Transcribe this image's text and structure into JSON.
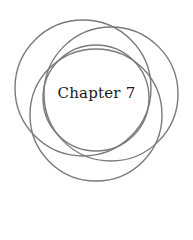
{
  "title": "Chapter 7",
  "emblem": {
    "stroke_color": "#7a7a7a",
    "circles": [
      {
        "cx": 96,
        "cy": 98,
        "r": 53
      },
      {
        "cx": 83,
        "cy": 88,
        "r": 68
      },
      {
        "cx": 111,
        "cy": 94,
        "r": 67
      },
      {
        "cx": 96,
        "cy": 115,
        "r": 66
      }
    ]
  }
}
